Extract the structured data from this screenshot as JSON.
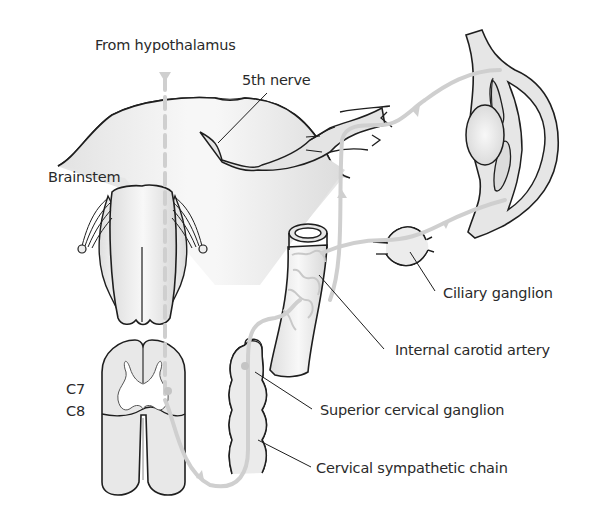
{
  "diagram": {
    "type": "anatomical pathway diagram",
    "labels": {
      "from_hypothalamus": "From hypothalamus",
      "fifth_nerve": "5th nerve",
      "brainstem": "Brainstem",
      "c7": "C7",
      "c8": "C8",
      "ciliary_ganglion": "Ciliary ganglion",
      "internal_carotid_artery": "Internal carotid artery",
      "superior_cervical_ganglion": "Superior cervical ganglion",
      "cervical_sympathetic_chain": "Cervical sympathetic chain"
    },
    "structures": [
      "hypothalamus input arrow",
      "brainstem",
      "medulla",
      "spinal cord (C7-C8)",
      "cervical sympathetic chain",
      "superior cervical ganglion",
      "internal carotid artery",
      "5th nerve",
      "ciliary ganglion",
      "eye"
    ],
    "colors": {
      "outline": "#1e1e1e",
      "pathway": "#d0d0d0",
      "fill": "#ececec",
      "text": "#2a2a2a",
      "background": "#ffffff"
    }
  }
}
